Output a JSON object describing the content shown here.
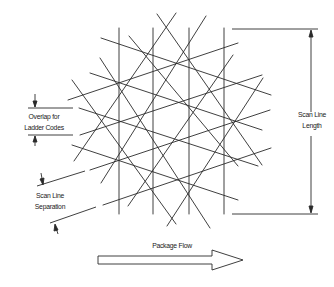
{
  "diagram": {
    "labels": {
      "overlap_line1": "Overlap for",
      "overlap_line2": "Ladder Codes",
      "length_line1": "Scan Line",
      "length_line2": "Length",
      "separation_line1": "Scan Line",
      "separation_line2": "Separation",
      "flow": "Package Flow"
    },
    "colors": {
      "stroke": "#2a2a2a",
      "background": "#ffffff",
      "text": "#1a1a1a"
    },
    "pattern": {
      "vertical_lines_x": [
        119,
        153,
        189,
        224
      ],
      "vertical_top": 28,
      "vertical_bottom": 214
    }
  }
}
